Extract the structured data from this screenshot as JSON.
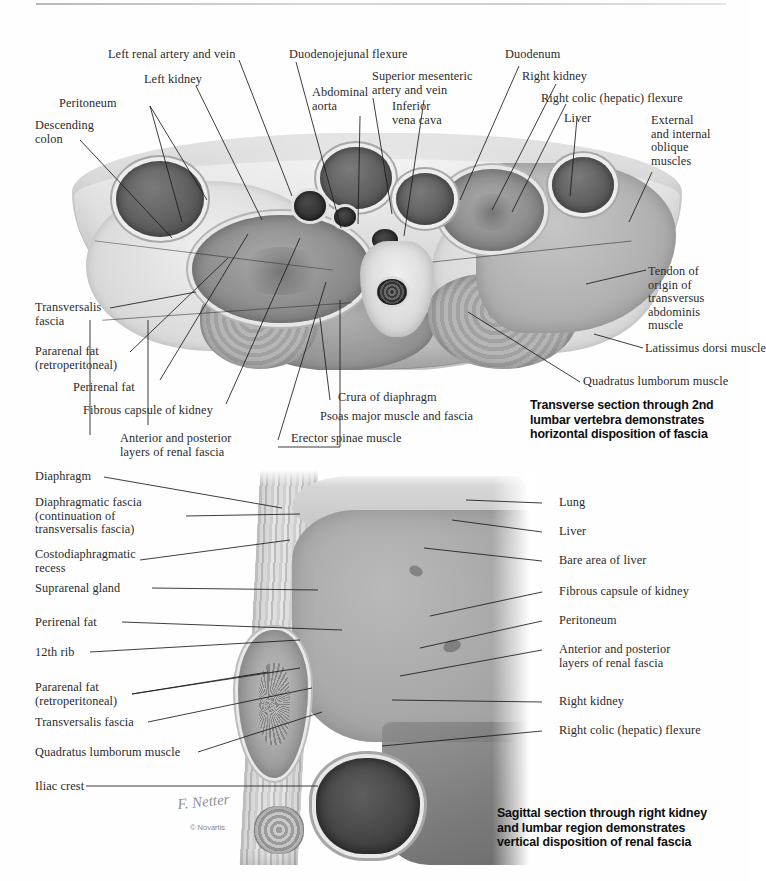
{
  "plate": {
    "artist_signature": "F. Netter",
    "copyright": "© Novartis"
  },
  "figures": [
    {
      "id": "transverse",
      "caption": "Transverse section through 2nd\nlumbar vertebra demonstrates\nhorizontal disposition of fascia",
      "labels": [
        {
          "key": "left-renal-artery-and-vein",
          "text": "Left renal artery and vein"
        },
        {
          "key": "left-kidney",
          "text": "Left kidney"
        },
        {
          "key": "peritoneum",
          "text": "Peritoneum"
        },
        {
          "key": "descending-colon",
          "text": "Descending\ncolon"
        },
        {
          "key": "duodenojejunal-flexure",
          "text": "Duodenojejunal flexure"
        },
        {
          "key": "abdominal-aorta",
          "text": "Abdominal\naorta"
        },
        {
          "key": "superior-mesenteric-artery-and-vein",
          "text": "Superior mesenteric\nartery and vein"
        },
        {
          "key": "inferior-vena-cava",
          "text": "Inferior\nvena cava"
        },
        {
          "key": "duodenum",
          "text": "Duodenum"
        },
        {
          "key": "right-kidney",
          "text": "Right kidney"
        },
        {
          "key": "right-colic-hepatic-flexure",
          "text": "Right colic (hepatic) flexure"
        },
        {
          "key": "liver",
          "text": "Liver"
        },
        {
          "key": "external-and-internal-oblique-muscles",
          "text": "External\nand internal\noblique\nmuscles"
        },
        {
          "key": "tendon-of-origin-of-transversus-abdominis-muscle",
          "text": "Tendon of\norigin of\ntransversus\nabdominis\nmuscle"
        },
        {
          "key": "latissimus-dorsi-muscle",
          "text": "Latissimus dorsi muscle"
        },
        {
          "key": "quadratus-lumborum-muscle",
          "text": "Quadratus lumborum muscle"
        },
        {
          "key": "transversalis-fascia",
          "text": "Transversalis\nfascia"
        },
        {
          "key": "pararenal-fat-retroperitoneal",
          "text": "Pararenal fat\n(retroperitoneal)"
        },
        {
          "key": "perirenal-fat",
          "text": "Perirenal fat"
        },
        {
          "key": "fibrous-capsule-of-kidney",
          "text": "Fibrous capsule of kidney"
        },
        {
          "key": "anterior-and-posterior-layers-of-renal-fascia",
          "text": "Anterior and posterior\nlayers of renal fascia"
        },
        {
          "key": "erector-spinae-muscle",
          "text": "Erector spinae muscle"
        },
        {
          "key": "psoas-major-muscle-and-fascia",
          "text": "Psoas major muscle and fascia"
        },
        {
          "key": "crura-of-diaphragm",
          "text": "Crura of diaphragm"
        }
      ]
    },
    {
      "id": "sagittal",
      "caption": "Sagittal section through right kidney\nand lumbar region demonstrates\nvertical disposition of renal fascia",
      "labels": [
        {
          "key": "diaphragm",
          "text": "Diaphragm"
        },
        {
          "key": "diaphragmatic-fascia",
          "text": "Diaphragmatic fascia\n(continuation of\ntransversalis fascia)"
        },
        {
          "key": "costodiaphragmatic-recess",
          "text": "Costodiaphragmatic\nrecess"
        },
        {
          "key": "suprarenal-gland",
          "text": "Suprarenal gland"
        },
        {
          "key": "perirenal-fat",
          "text": "Perirenal fat"
        },
        {
          "key": "12th-rib",
          "text": "12th rib"
        },
        {
          "key": "pararenal-fat-retroperitoneal",
          "text": "Pararenal fat\n(retroperitoneal)"
        },
        {
          "key": "transversalis-fascia",
          "text": "Transversalis fascia"
        },
        {
          "key": "quadratus-lumborum-muscle",
          "text": "Quadratus lumborum muscle"
        },
        {
          "key": "iliac-crest",
          "text": "Iliac crest"
        },
        {
          "key": "lung",
          "text": "Lung"
        },
        {
          "key": "liver",
          "text": "Liver"
        },
        {
          "key": "bare-area-of-liver",
          "text": "Bare area of liver"
        },
        {
          "key": "fibrous-capsule-of-kidney",
          "text": "Fibrous capsule of kidney"
        },
        {
          "key": "peritoneum",
          "text": "Peritoneum"
        },
        {
          "key": "anterior-and-posterior-layers-of-renal-fascia",
          "text": "Anterior and posterior\nlayers of renal fascia"
        },
        {
          "key": "right-kidney",
          "text": "Right kidney"
        },
        {
          "key": "right-colic-hepatic-flexure",
          "text": "Right colic (hepatic) flexure"
        }
      ]
    }
  ],
  "colors": {
    "ink": "#2b2b2b",
    "caption": "#0d0d0d",
    "leader": "#1b1b1b",
    "page": "#fefefe"
  }
}
